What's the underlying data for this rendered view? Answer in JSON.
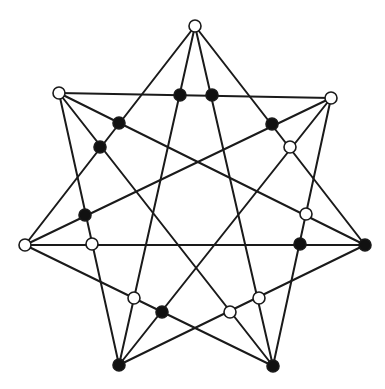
{
  "diagram": {
    "type": "heptagram-graph",
    "colors": {
      "line": "#1a1a1a",
      "black_node": "#111111",
      "white_node": "#ffffff"
    },
    "outer_vertices": [
      {
        "id": "v0",
        "x": 195,
        "y": 26,
        "fill": "white"
      },
      {
        "id": "v1",
        "x": 331,
        "y": 98,
        "fill": "white"
      },
      {
        "id": "v2",
        "x": 365,
        "y": 245,
        "fill": "black"
      },
      {
        "id": "v3",
        "x": 273,
        "y": 366,
        "fill": "black"
      },
      {
        "id": "v4",
        "x": 119,
        "y": 365,
        "fill": "black"
      },
      {
        "id": "v5",
        "x": 25,
        "y": 245,
        "fill": "white"
      },
      {
        "id": "v6",
        "x": 59,
        "y": 93,
        "fill": "white"
      }
    ],
    "edges": [
      [
        "v0",
        "v2"
      ],
      [
        "v0",
        "v3"
      ],
      [
        "v0",
        "v4"
      ],
      [
        "v0",
        "v5"
      ],
      [
        "v1",
        "v3"
      ],
      [
        "v1",
        "v4"
      ],
      [
        "v1",
        "v5"
      ],
      [
        "v1",
        "v6"
      ],
      [
        "v2",
        "v4"
      ],
      [
        "v2",
        "v5"
      ],
      [
        "v2",
        "v6"
      ],
      [
        "v3",
        "v5"
      ],
      [
        "v3",
        "v6"
      ],
      [
        "v4",
        "v6"
      ]
    ],
    "inner_nodes": [
      {
        "x": 180,
        "y": 95,
        "fill": "black"
      },
      {
        "x": 212,
        "y": 95,
        "fill": "black"
      },
      {
        "x": 119,
        "y": 123,
        "fill": "black"
      },
      {
        "x": 100,
        "y": 147,
        "fill": "black"
      },
      {
        "x": 272,
        "y": 124,
        "fill": "black"
      },
      {
        "x": 290,
        "y": 147,
        "fill": "white"
      },
      {
        "x": 85,
        "y": 215,
        "fill": "black"
      },
      {
        "x": 92,
        "y": 244,
        "fill": "white"
      },
      {
        "x": 306,
        "y": 214,
        "fill": "white"
      },
      {
        "x": 300,
        "y": 244,
        "fill": "black"
      },
      {
        "x": 134,
        "y": 298,
        "fill": "white"
      },
      {
        "x": 162,
        "y": 312,
        "fill": "black"
      },
      {
        "x": 230,
        "y": 312,
        "fill": "white"
      },
      {
        "x": 259,
        "y": 298,
        "fill": "white"
      }
    ],
    "node_radius": 6
  }
}
